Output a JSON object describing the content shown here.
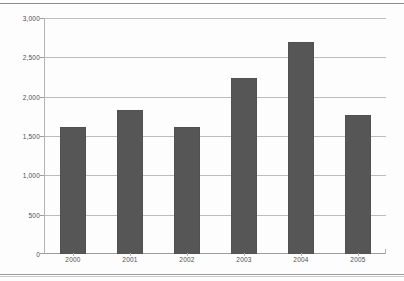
{
  "chart_data": {
    "type": "bar",
    "title": "",
    "subtitle": "",
    "xlabel": "",
    "ylabel": "",
    "categories": [
      "2000",
      "2001",
      "2002",
      "2003",
      "2004",
      "2005"
    ],
    "values": [
      1610,
      1835,
      1620,
      2240,
      2690,
      1765
    ],
    "series": [
      {
        "name": "",
        "values": [
          1610,
          1835,
          1620,
          2240,
          2690,
          1765
        ]
      }
    ],
    "ylim": [
      0,
      3000
    ],
    "ytick_values": [
      0,
      500,
      1000,
      1500,
      2000,
      2500,
      3000
    ],
    "ytick_labels": [
      "0",
      "500",
      "1,000",
      "1,500",
      "2,000",
      "2,500",
      "3,000"
    ],
    "xtick_labels": [
      "2000",
      "2001",
      "2002",
      "2003",
      "2004",
      "2005"
    ],
    "grid": true,
    "grid_axis": "y",
    "legend": false,
    "legend_position": "none",
    "bar_color": "#565656",
    "gridline_color": "#bcbcbc",
    "axis_color": "#9d9d9d",
    "background_color": "#fdfdfd",
    "text_color": "#4d4d4d"
  },
  "page": {
    "rule_color": "#8d8d8d"
  }
}
